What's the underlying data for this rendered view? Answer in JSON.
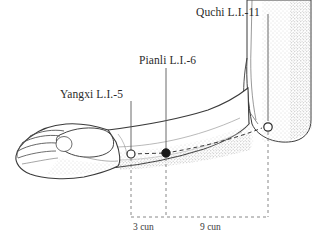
{
  "figure": {
    "background_color": "#ffffff",
    "ink_color": "#2b2b2b",
    "stipple_color": "#9a9a9a"
  },
  "labels": {
    "quchi": "Quchi L.I.-11",
    "pianli": "Pianli L.I.-6",
    "yangxi": "Yangxi L.I.-5"
  },
  "measurements": {
    "proximal_segment": "3 cun",
    "distal_segment": "9 cun"
  },
  "points": [
    {
      "id": "yangxi",
      "name": "Yangxi L.I.-5",
      "marker": "open-circle",
      "x": 131,
      "y": 154
    },
    {
      "id": "pianli",
      "name": "Pianli L.I.-6",
      "marker": "filled-circle",
      "x": 166,
      "y": 153
    },
    {
      "id": "quchi",
      "name": "Quchi L.I.-11",
      "marker": "open-circle",
      "x": 268,
      "y": 127
    }
  ],
  "leader_lines": [
    {
      "id": "leader-quchi",
      "x": 268,
      "y_top": 14,
      "y_bottom": 121
    },
    {
      "id": "leader-pianli",
      "x": 166,
      "y_top": 68,
      "y_bottom": 150
    },
    {
      "id": "leader-yangxi",
      "x": 131,
      "y_top": 101,
      "y_bottom": 151
    }
  ],
  "dimension_lines": {
    "baseline_y": 217,
    "x_start": 131,
    "x_mid": 166,
    "x_end": 268
  }
}
